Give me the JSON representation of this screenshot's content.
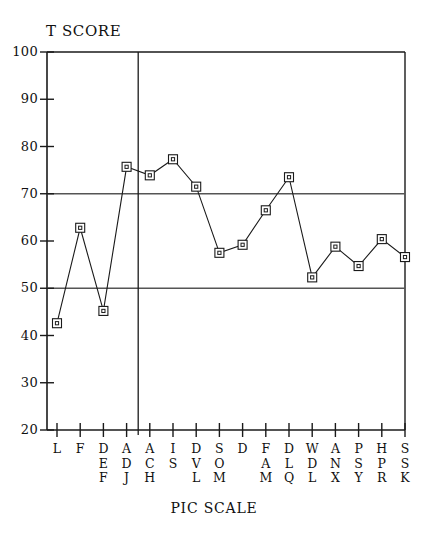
{
  "chart_data": {
    "type": "line",
    "title": "",
    "ylabel": "T SCORE",
    "xlabel": "PIC SCALE",
    "ylim": [
      20,
      100
    ],
    "ytick_labels": [
      "100",
      "90",
      "80",
      "70",
      "60",
      "50",
      "40",
      "30",
      "20"
    ],
    "yticks": [
      100,
      90,
      80,
      70,
      60,
      50,
      40,
      30,
      20
    ],
    "grid": false,
    "reference_lines": [
      70,
      50
    ],
    "vertical_divider_after_category": "ADJ",
    "legend": [],
    "marker": "open-square",
    "categories": [
      "L",
      "F",
      "DEF",
      "ADJ",
      "ACH",
      "IS",
      "DVL",
      "SOM",
      "D",
      "FAM",
      "DLQ",
      "WDL",
      "ANX",
      "PSY",
      "HPR",
      "SSK"
    ],
    "category_letters": [
      [
        "L"
      ],
      [
        "F"
      ],
      [
        "D",
        "E",
        "F"
      ],
      [
        "A",
        "D",
        "J"
      ],
      [
        "A",
        "C",
        "H"
      ],
      [
        "I",
        "S"
      ],
      [
        "D",
        "V",
        "L"
      ],
      [
        "S",
        "O",
        "M"
      ],
      [
        "D"
      ],
      [
        "F",
        "A",
        "M"
      ],
      [
        "D",
        "L",
        "Q"
      ],
      [
        "W",
        "D",
        "L"
      ],
      [
        "A",
        "N",
        "X"
      ],
      [
        "P",
        "S",
        "Y"
      ],
      [
        "H",
        "P",
        "R"
      ],
      [
        "S",
        "S",
        "K"
      ]
    ],
    "values": [
      42.6,
      62.8,
      45.2,
      75.7,
      73.9,
      77.3,
      71.5,
      57.5,
      59.2,
      66.5,
      73.5,
      52.3,
      58.8,
      54.7,
      60.4,
      56.6
    ]
  },
  "colors": {
    "line": "#1a1a1a",
    "axis": "#1a1a1a",
    "background": "#ffffff",
    "reference_line": "#555555"
  }
}
